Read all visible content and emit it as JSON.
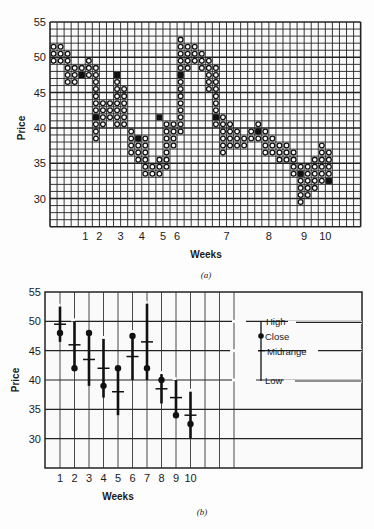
{
  "chart_data": [
    {
      "id": "a",
      "type": "scatter",
      "subtype": "point-and-figure-grid",
      "caption": "(a)",
      "title": "",
      "xlabel": "Weeks",
      "ylabel": "Price",
      "ylim": [
        26,
        55
      ],
      "yticks": [
        30,
        35,
        40,
        45,
        50,
        55
      ],
      "grid": true,
      "grid_unit": 1,
      "x_week_labels": [
        {
          "label": "1",
          "col": 5.5
        },
        {
          "label": "2",
          "col": 7.5
        },
        {
          "label": "3",
          "col": 10.5
        },
        {
          "label": "4",
          "col": 13.5
        },
        {
          "label": "5",
          "col": 16.5
        },
        {
          "label": "6",
          "col": 18.5
        },
        {
          "label": "7",
          "col": 25.5
        },
        {
          "label": "8",
          "col": 31.5
        },
        {
          "label": "9",
          "col": 36.5
        },
        {
          "label": "10",
          "col": 39.5
        }
      ],
      "columns": [
        {
          "col": 1,
          "low": 50,
          "high": 52
        },
        {
          "col": 2,
          "low": 50,
          "high": 52
        },
        {
          "col": 3,
          "low": 47,
          "high": 51
        },
        {
          "col": 4,
          "low": 47,
          "high": 49
        },
        {
          "col": 5,
          "low": 48,
          "high": 49
        },
        {
          "col": 6,
          "low": 48,
          "high": 50
        },
        {
          "col": 7,
          "low": 39,
          "high": 49
        },
        {
          "col": 8,
          "low": 41,
          "high": 44
        },
        {
          "col": 9,
          "low": 42,
          "high": 44
        },
        {
          "col": 10,
          "low": 41,
          "high": 47
        },
        {
          "col": 11,
          "low": 41,
          "high": 46
        },
        {
          "col": 12,
          "low": 37,
          "high": 40
        },
        {
          "col": 13,
          "low": 36,
          "high": 39
        },
        {
          "col": 14,
          "low": 34,
          "high": 39
        },
        {
          "col": 15,
          "low": 34,
          "high": 35
        },
        {
          "col": 16,
          "low": 34,
          "high": 36
        },
        {
          "col": 17,
          "low": 35,
          "high": 41
        },
        {
          "col": 18,
          "low": 38,
          "high": 41
        },
        {
          "col": 19,
          "low": 40,
          "high": 53
        },
        {
          "col": 20,
          "low": 49,
          "high": 52
        },
        {
          "col": 21,
          "low": 50,
          "high": 52
        },
        {
          "col": 22,
          "low": 49,
          "high": 51
        },
        {
          "col": 23,
          "low": 46,
          "high": 50
        },
        {
          "col": 24,
          "low": 41,
          "high": 49
        },
        {
          "col": 25,
          "low": 37,
          "high": 42
        },
        {
          "col": 26,
          "low": 38,
          "high": 41
        },
        {
          "col": 27,
          "low": 38,
          "high": 40
        },
        {
          "col": 28,
          "low": 38,
          "high": 39
        },
        {
          "col": 29,
          "low": 39,
          "high": 40
        },
        {
          "col": 30,
          "low": 39,
          "high": 41
        },
        {
          "col": 31,
          "low": 37,
          "high": 40
        },
        {
          "col": 32,
          "low": 37,
          "high": 39
        },
        {
          "col": 33,
          "low": 36,
          "high": 38
        },
        {
          "col": 34,
          "low": 36,
          "high": 38
        },
        {
          "col": 35,
          "low": 34,
          "high": 37
        },
        {
          "col": 36,
          "low": 30,
          "high": 35
        },
        {
          "col": 37,
          "low": 31,
          "high": 35
        },
        {
          "col": 38,
          "low": 32,
          "high": 36
        },
        {
          "col": 39,
          "low": 33,
          "high": 38
        },
        {
          "col": 40,
          "low": 33,
          "high": 37
        }
      ],
      "closes": [
        {
          "col": 5,
          "price": 48
        },
        {
          "col": 7,
          "price": 42
        },
        {
          "col": 10,
          "price": 48
        },
        {
          "col": 13,
          "price": 39
        },
        {
          "col": 16,
          "price": 42
        },
        {
          "col": 19,
          "price": 48
        },
        {
          "col": 24,
          "price": 42
        },
        {
          "col": 30,
          "price": 40
        },
        {
          "col": 36,
          "price": 34
        },
        {
          "col": 40,
          "price": 33
        }
      ]
    },
    {
      "id": "b",
      "type": "bar",
      "subtype": "high-low-close-midrange",
      "caption": "(b)",
      "title": "",
      "xlabel": "Weeks",
      "ylabel": "Price",
      "ylim": [
        25,
        55
      ],
      "yticks": [
        30,
        35,
        40,
        45,
        50,
        55
      ],
      "grid": true,
      "categories": [
        "1",
        "2",
        "3",
        "4",
        "5",
        "6",
        "7",
        "8",
        "9",
        "10"
      ],
      "series": [
        {
          "name": "High",
          "values": [
            52.5,
            50,
            48,
            47,
            42,
            48,
            53,
            41,
            40,
            38
          ]
        },
        {
          "name": "Low",
          "values": [
            46.5,
            42,
            39,
            37,
            34,
            40,
            40,
            36,
            34,
            30
          ]
        },
        {
          "name": "Close",
          "values": [
            48,
            42,
            48,
            39,
            42,
            47.5,
            42,
            40,
            34,
            32.5
          ]
        },
        {
          "name": "Midrange",
          "values": [
            49.5,
            46,
            43.5,
            42,
            38,
            44,
            46.5,
            38.5,
            37,
            34
          ]
        }
      ],
      "legend": {
        "position": "right-inside",
        "entries": [
          "High",
          "Close",
          "Midrange",
          "Low"
        ]
      }
    }
  ]
}
